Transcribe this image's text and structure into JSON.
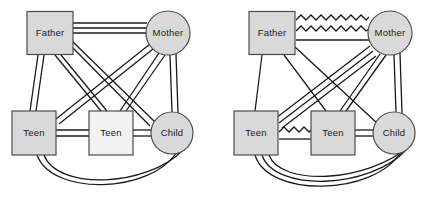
{
  "figure": {
    "type": "family-systems-genogram-pair",
    "background_color": "#ffffff",
    "width": 445,
    "height": 198,
    "node_fill": "#d9d9d9",
    "node_stroke": "#4d4d4d",
    "line_color": "#1a1a1a"
  },
  "panels": [
    {
      "id": "left",
      "name": "left-genogram",
      "nodes": [
        {
          "id": "father",
          "label": "Father",
          "shape": "square",
          "x": 50,
          "y": 33,
          "w": 46,
          "h": 43
        },
        {
          "id": "mother",
          "label": "Mother",
          "shape": "circle",
          "x": 168,
          "y": 33,
          "r": 22
        },
        {
          "id": "teen1",
          "label": "Teen",
          "shape": "square",
          "x": 34,
          "y": 133,
          "w": 44,
          "h": 44
        },
        {
          "id": "teen2",
          "label": "Teen",
          "shape": "square",
          "x": 111,
          "y": 133,
          "w": 44,
          "h": 44
        },
        {
          "id": "child",
          "label": "Child",
          "shape": "circle",
          "x": 172,
          "y": 133,
          "r": 21
        }
      ],
      "edges": [
        {
          "from": "father",
          "to": "mother",
          "style": "triple-straight",
          "relation": "fused"
        },
        {
          "from": "father",
          "to": "teen1",
          "style": "double-straight",
          "relation": "fused"
        },
        {
          "from": "father",
          "to": "teen2",
          "style": "double-straight",
          "relation": "fused"
        },
        {
          "from": "father",
          "to": "child",
          "style": "double-straight",
          "relation": "fused"
        },
        {
          "from": "mother",
          "to": "teen1",
          "style": "double-straight",
          "relation": "fused"
        },
        {
          "from": "mother",
          "to": "teen2",
          "style": "double-straight",
          "relation": "fused"
        },
        {
          "from": "mother",
          "to": "child",
          "style": "double-straight",
          "relation": "fused"
        },
        {
          "from": "teen1",
          "to": "teen2",
          "style": "double-straight",
          "relation": "fused"
        },
        {
          "from": "teen2",
          "to": "child",
          "style": "double-straight",
          "relation": "fused"
        },
        {
          "from": "teen1",
          "to": "child",
          "style": "double-arc",
          "relation": "fused"
        }
      ]
    },
    {
      "id": "right",
      "name": "right-genogram",
      "nodes": [
        {
          "id": "father",
          "label": "Father",
          "shape": "square",
          "x": 50,
          "y": 33,
          "w": 46,
          "h": 43
        },
        {
          "id": "mother",
          "label": "Mother",
          "shape": "circle",
          "x": 168,
          "y": 33,
          "r": 22
        },
        {
          "id": "teen1",
          "label": "Teen",
          "shape": "square",
          "x": 34,
          "y": 133,
          "w": 44,
          "h": 44
        },
        {
          "id": "teen2",
          "label": "Teen",
          "shape": "square",
          "x": 111,
          "y": 133,
          "w": 44,
          "h": 44
        },
        {
          "id": "child",
          "label": "Child",
          "shape": "circle",
          "x": 172,
          "y": 133,
          "r": 21
        }
      ],
      "edges": [
        {
          "from": "father",
          "to": "mother",
          "style": "double-zigzag-plus-line",
          "relation": "conflict"
        },
        {
          "from": "father",
          "to": "teen1",
          "style": "single-straight",
          "relation": "normal"
        },
        {
          "from": "father",
          "to": "teen2",
          "style": "single-straight",
          "relation": "normal"
        },
        {
          "from": "father",
          "to": "child",
          "style": "single-straight",
          "relation": "normal"
        },
        {
          "from": "mother",
          "to": "teen1",
          "style": "triple-straight",
          "relation": "fused"
        },
        {
          "from": "mother",
          "to": "teen2",
          "style": "double-straight",
          "relation": "fused"
        },
        {
          "from": "mother",
          "to": "child",
          "style": "double-straight",
          "relation": "fused"
        },
        {
          "from": "teen1",
          "to": "teen2",
          "style": "zigzag-plus-line",
          "relation": "conflict"
        },
        {
          "from": "teen2",
          "to": "child",
          "style": "double-straight",
          "relation": "fused"
        },
        {
          "from": "teen1",
          "to": "child",
          "style": "triple-arc",
          "relation": "fused"
        }
      ]
    }
  ]
}
